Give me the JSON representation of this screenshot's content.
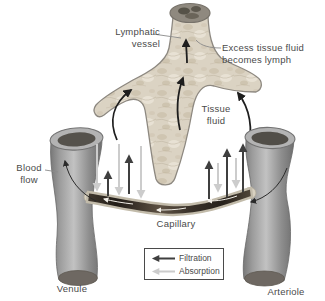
{
  "colors": {
    "filtration_arrow": "#3f3f3f",
    "absorption_arrow": "#cccccc",
    "lymph_vessel_fill": "#dbd3c3",
    "blood_vessel_gray": "#b0b0b0",
    "capillary_dark": "#33291f",
    "label_text": "#4a4a4a"
  },
  "labels": {
    "lymphatic_vessel": [
      "Lymphatic",
      "vessel"
    ],
    "excess_tissue_fluid": [
      "Excess tissue fluid",
      "becomes lymph"
    ],
    "tissue_fluid": [
      "Tissue",
      "fluid"
    ],
    "blood_flow": [
      "Blood",
      "flow"
    ],
    "capillary": "Capillary",
    "venule": "Venule",
    "arteriole": "Arteriole"
  },
  "legend": {
    "items": [
      {
        "label": "Filtration",
        "color": "#3f3f3f"
      },
      {
        "label": "Absorption",
        "color": "#cccccc"
      }
    ]
  }
}
